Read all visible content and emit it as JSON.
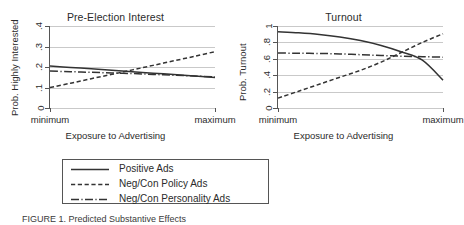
{
  "figure": {
    "caption": "FIGURE 1.  Predicted Substantive Effects"
  },
  "legend": {
    "items": [
      {
        "label": "Positive Ads",
        "style": "solid",
        "sample": "solid-line-sample"
      },
      {
        "label": "Neg/Con Policy Ads",
        "style": "dashed",
        "sample": "dashed-line-sample"
      },
      {
        "label": "Neg/Con Personality Ads",
        "style": "dashdot",
        "sample": "dashdot-line-sample"
      }
    ]
  },
  "chart_data": [
    {
      "type": "line",
      "panel": "left",
      "title": "Pre-Election Interest",
      "xlabel": "Exposure to Advertising",
      "ylabel": "Prob. Highly Interested",
      "xticks": [
        "minimum",
        "maximum"
      ],
      "xtick_positions": [
        0,
        1
      ],
      "yticks": [
        "0",
        ".1",
        ".2",
        ".3",
        ".4"
      ],
      "ytick_values": [
        0,
        0.1,
        0.2,
        0.3,
        0.4
      ],
      "ylim": [
        0,
        0.4
      ],
      "xlim": [
        0,
        1
      ],
      "grid": true,
      "legend_position": "below-figure",
      "x": [
        0,
        0.125,
        0.25,
        0.375,
        0.5,
        0.625,
        0.75,
        0.875,
        1
      ],
      "series": [
        {
          "name": "Positive Ads",
          "style": "solid",
          "values": [
            0.205,
            0.198,
            0.191,
            0.184,
            0.177,
            0.17,
            0.163,
            0.156,
            0.149
          ]
        },
        {
          "name": "Neg/Con Policy Ads",
          "style": "dashed",
          "values": [
            0.1,
            0.121,
            0.143,
            0.164,
            0.186,
            0.208,
            0.23,
            0.252,
            0.275
          ]
        },
        {
          "name": "Neg/Con Personality Ads",
          "style": "dashdot",
          "values": [
            0.18,
            0.177,
            0.174,
            0.171,
            0.168,
            0.164,
            0.16,
            0.156,
            0.152
          ]
        }
      ]
    },
    {
      "type": "line",
      "panel": "right",
      "title": "Turnout",
      "xlabel": "Exposure to Advertising",
      "ylabel": "Prob. Turnout",
      "xticks": [
        "minimum",
        "maximum"
      ],
      "xtick_positions": [
        0,
        1
      ],
      "yticks": [
        "0",
        ".2",
        ".4",
        ".6",
        ".8",
        "1"
      ],
      "ytick_values": [
        0,
        0.2,
        0.4,
        0.6,
        0.8,
        1.0
      ],
      "ylim": [
        0,
        1
      ],
      "xlim": [
        0,
        1
      ],
      "grid": true,
      "legend_position": "below-figure",
      "x": [
        0,
        0.125,
        0.25,
        0.375,
        0.5,
        0.625,
        0.75,
        0.875,
        1
      ],
      "series": [
        {
          "name": "Positive Ads",
          "style": "solid",
          "values": [
            0.93,
            0.917,
            0.897,
            0.866,
            0.822,
            0.762,
            0.683,
            0.583,
            0.34
          ]
        },
        {
          "name": "Neg/Con Policy Ads",
          "style": "dashed",
          "values": [
            0.12,
            0.205,
            0.29,
            0.375,
            0.46,
            0.56,
            0.68,
            0.8,
            0.905
          ]
        },
        {
          "name": "Neg/Con Personality Ads",
          "style": "dashdot",
          "values": [
            0.67,
            0.668,
            0.665,
            0.66,
            0.65,
            0.64,
            0.632,
            0.626,
            0.62
          ]
        }
      ]
    }
  ]
}
